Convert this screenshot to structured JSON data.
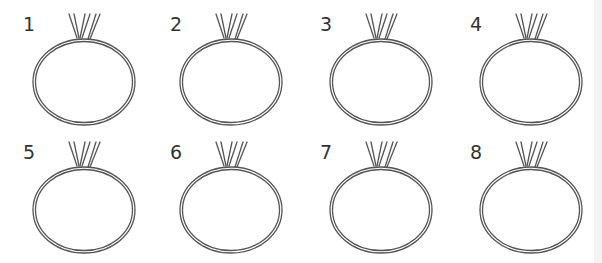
{
  "figure": {
    "stroke_color": "#555555",
    "items": [
      {
        "label": "1",
        "row": 0,
        "col": 0
      },
      {
        "label": "2",
        "row": 0,
        "col": 1
      },
      {
        "label": "3",
        "row": 0,
        "col": 2
      },
      {
        "label": "4",
        "row": 0,
        "col": 3
      },
      {
        "label": "5",
        "row": 1,
        "col": 0
      },
      {
        "label": "6",
        "row": 1,
        "col": 1
      },
      {
        "label": "7",
        "row": 1,
        "col": 2
      },
      {
        "label": "8",
        "row": 1,
        "col": 3
      }
    ]
  }
}
